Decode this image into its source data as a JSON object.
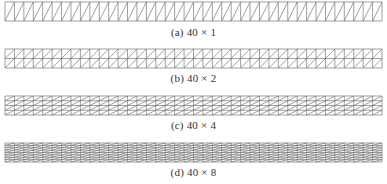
{
  "figure": {
    "mesh_style": {
      "stroke": "#777777",
      "stroke_width": 0.7,
      "x_start": 5,
      "x_end": 382,
      "height": 19
    },
    "panels": [
      {
        "label": "(a)",
        "dims": "40 × 1",
        "cols": 40,
        "rows": 1,
        "mesh_top": 2,
        "caption_top": 26
      },
      {
        "label": "(b)",
        "dims": "40 × 2",
        "cols": 40,
        "rows": 2,
        "mesh_top": 49,
        "caption_top": 72
      },
      {
        "label": "(c)",
        "dims": "40 × 4",
        "cols": 40,
        "rows": 4,
        "mesh_top": 96,
        "caption_top": 119
      },
      {
        "label": "(d)",
        "dims": "40 × 8",
        "cols": 40,
        "rows": 8,
        "mesh_top": 143,
        "caption_top": 166
      }
    ]
  }
}
